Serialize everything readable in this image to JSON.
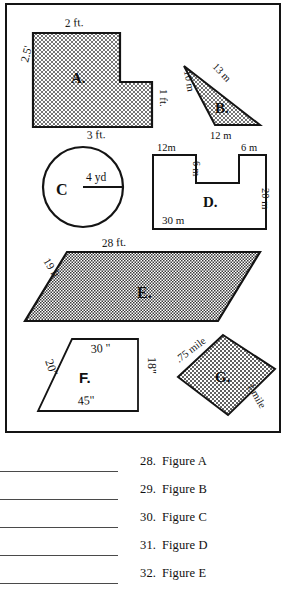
{
  "worksheet": {
    "figure_box": {
      "figures": [
        {
          "id": "A",
          "label": "A.",
          "shape": "L-shaped hexagon",
          "filled": true,
          "dimensions": [
            {
              "name": "top-width",
              "text": "2 ft."
            },
            {
              "name": "left-height",
              "text": "2.5'"
            },
            {
              "name": "right-step-height",
              "text": "1 ft."
            },
            {
              "name": "bottom-width",
              "text": "3 ft."
            }
          ]
        },
        {
          "id": "B",
          "label": "B.",
          "shape": "right triangle",
          "filled": true,
          "dimensions": [
            {
              "name": "left-side",
              "text": "10 m"
            },
            {
              "name": "hypotenuse",
              "text": "13 m"
            },
            {
              "name": "base",
              "text": "12 m"
            }
          ]
        },
        {
          "id": "C",
          "label": "C",
          "shape": "circle",
          "filled": false,
          "dimensions": [
            {
              "name": "radius",
              "text": "4 yd"
            }
          ]
        },
        {
          "id": "D",
          "label": "D.",
          "shape": "U-shaped polygon",
          "filled": false,
          "dimensions": [
            {
              "name": "top-left-width",
              "text": "12m"
            },
            {
              "name": "top-right-width",
              "text": "6 m"
            },
            {
              "name": "notch-depth",
              "text": "6 m"
            },
            {
              "name": "right-height",
              "text": "20 m"
            },
            {
              "name": "bottom-width",
              "text": "30 m"
            }
          ]
        },
        {
          "id": "E",
          "label": "E.",
          "shape": "parallelogram",
          "filled": true,
          "dimensions": [
            {
              "name": "top-side",
              "text": "28 ft."
            },
            {
              "name": "slant-side",
              "text": "19 ft"
            }
          ]
        },
        {
          "id": "F",
          "label": "F.",
          "shape": "trapezoid",
          "filled": false,
          "dimensions": [
            {
              "name": "top-side",
              "text": "30 \""
            },
            {
              "name": "left-side",
              "text": "20\""
            },
            {
              "name": "right-side",
              "text": "18\""
            },
            {
              "name": "bottom-side",
              "text": "45\""
            }
          ]
        },
        {
          "id": "G",
          "label": "G.",
          "shape": "rhombus",
          "filled": true,
          "dimensions": [
            {
              "name": "upper-left-side",
              "text": ".75 mile"
            },
            {
              "name": "lower-right-side",
              "text": "1 mile"
            }
          ]
        }
      ]
    },
    "answers": {
      "items": [
        {
          "number": "28.",
          "label": "Figure A",
          "blank": ""
        },
        {
          "number": "29.",
          "label": "Figure B",
          "blank": ""
        },
        {
          "number": "30.",
          "label": "Figure C",
          "blank": ""
        },
        {
          "number": "31.",
          "label": "Figure D",
          "blank": ""
        },
        {
          "number": "32.",
          "label": "Figure E",
          "blank": ""
        }
      ]
    },
    "colors": {
      "ink": "#141414",
      "rule": "#4a4a4a",
      "paper": "#ffffff",
      "hatch": "#3a3a3a"
    }
  }
}
